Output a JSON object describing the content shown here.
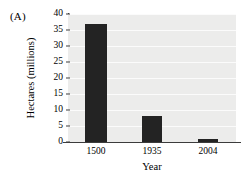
{
  "panel": {
    "label": "(A)"
  },
  "chart_data": {
    "type": "bar",
    "title": "",
    "panel_label": "(A)",
    "categories": [
      "1500",
      "1935",
      "2004"
    ],
    "values": [
      37,
      8,
      1
    ],
    "xlabel": "Year",
    "ylabel": "Hectares (millions)",
    "ylim": [
      0,
      40
    ],
    "ytick_values": [
      0,
      5,
      10,
      15,
      20,
      25,
      30,
      35,
      40
    ],
    "ytick_labels": [
      "0",
      "5",
      "10",
      "15",
      "20",
      "25",
      "30",
      "35",
      "40"
    ],
    "grid": "horizontal",
    "legend": "none",
    "bar_color": "#232323",
    "plot_background": "#ececeb",
    "gridline_color": "#fbfbfb",
    "axis_color": "#3c3c3c"
  }
}
